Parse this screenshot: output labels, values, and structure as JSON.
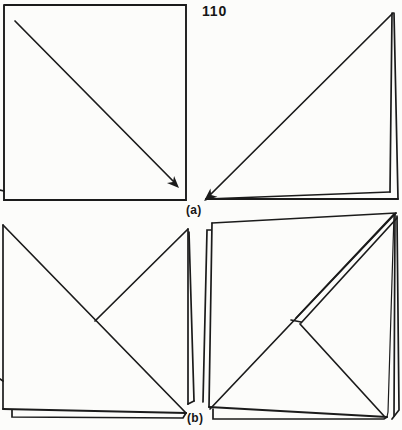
{
  "page": {
    "number": "110",
    "background": "#fcfcfa",
    "ink": "#1b1b1b",
    "stroke_width": 1.7
  },
  "labels": {
    "step_a": "(a)",
    "step_b": "(b)"
  },
  "figures": [
    {
      "name": "fig-a1-open-square-with-fold-arrow",
      "strokes": [
        {
          "points": [
            [
              4,
              5
            ],
            [
              186,
              5
            ],
            [
              186,
              200
            ],
            [
              4,
              200
            ],
            [
              4,
              5
            ]
          ],
          "width": 1.9
        },
        {
          "points": [
            [
              15,
              21
            ],
            [
              176,
              184
            ]
          ]
        }
      ],
      "arrows": [
        {
          "tip": [
            179,
            188
          ],
          "angle": 45,
          "size": 12
        }
      ]
    },
    {
      "name": "fig-a2-folded-triangle",
      "strokes": [
        {
          "points": [
            [
              393,
              13
            ],
            [
              207,
              198
            ]
          ]
        },
        {
          "points": [
            [
              206,
              199
            ],
            [
              398,
              199
            ]
          ],
          "width": 1.9
        },
        {
          "points": [
            [
              398,
              199
            ],
            [
              394,
              13
            ]
          ]
        },
        {
          "points": [
            [
              206,
              199
            ],
            [
              390,
              192
            ]
          ]
        },
        {
          "points": [
            [
              390,
              192
            ],
            [
              392,
              13
            ]
          ]
        }
      ],
      "arrows": [
        {
          "tip": [
            204,
            201
          ],
          "angle": 140,
          "size": 13
        }
      ]
    },
    {
      "name": "fig-b1-square-with-corner-flap",
      "strokes": [
        {
          "points": [
            [
              3,
              225
            ],
            [
              3,
              409
            ]
          ]
        },
        {
          "points": [
            [
              3,
              225
            ],
            [
              186,
              413
            ]
          ]
        },
        {
          "points": [
            [
              3,
              409
            ],
            [
              186,
              413
            ]
          ],
          "width": 1.9
        },
        {
          "points": [
            [
              12,
              410
            ],
            [
              12,
              417
            ],
            [
              183,
              418
            ],
            [
              186,
              413
            ]
          ]
        },
        {
          "points": [
            [
              95,
              321
            ],
            [
              188,
              229
            ]
          ]
        },
        {
          "points": [
            [
              188,
              229
            ],
            [
              188,
              404
            ]
          ]
        },
        {
          "points": [
            [
              189,
              232
            ],
            [
              194,
              401
            ]
          ]
        },
        {
          "points": [
            [
              188,
              404
            ],
            [
              194,
              401
            ]
          ]
        }
      ],
      "arrows": []
    },
    {
      "name": "fig-b2-square-folded-layers",
      "strokes": [
        {
          "points": [
            [
              212,
              223
            ],
            [
              396,
              213
            ]
          ]
        },
        {
          "points": [
            [
              212,
              223
            ],
            [
              209,
              407
            ]
          ]
        },
        {
          "points": [
            [
              211,
              230
            ],
            [
              207,
              230
            ],
            [
              203,
              402
            ]
          ]
        },
        {
          "points": [
            [
              209,
              407
            ],
            [
              387,
              417
            ]
          ],
          "width": 1.9
        },
        {
          "points": [
            [
              213,
              409
            ],
            [
              213,
              419
            ],
            [
              384,
              419
            ],
            [
              387,
              417
            ]
          ]
        },
        {
          "points": [
            [
              210,
              409
            ],
            [
              396,
              213
            ]
          ]
        },
        {
          "points": [
            [
              296,
              318
            ],
            [
              394,
              214
            ]
          ]
        },
        {
          "points": [
            [
              301,
              323
            ],
            [
              397,
              218
            ]
          ]
        },
        {
          "points": [
            [
              291,
              320
            ],
            [
              301,
              322
            ]
          ]
        },
        {
          "points": [
            [
              300,
              324
            ],
            [
              384,
              416
            ]
          ]
        },
        {
          "points": [
            [
              394,
              214
            ],
            [
              388,
              412
            ],
            [
              387,
              417
            ]
          ],
          "width": 1.2
        },
        {
          "points": [
            [
              395,
              214
            ],
            [
              394,
              416
            ]
          ]
        },
        {
          "points": [
            [
              397,
              216
            ],
            [
              399,
              410
            ],
            [
              392,
              419
            ]
          ]
        }
      ],
      "arrows": []
    },
    {
      "name": "scan-edge-marks",
      "strokes": [
        {
          "points": [
            [
              0,
              190
            ],
            [
              4,
              191
            ]
          ]
        },
        {
          "points": [
            [
              0,
              379
            ],
            [
              3,
              381
            ]
          ]
        }
      ],
      "arrows": []
    }
  ]
}
